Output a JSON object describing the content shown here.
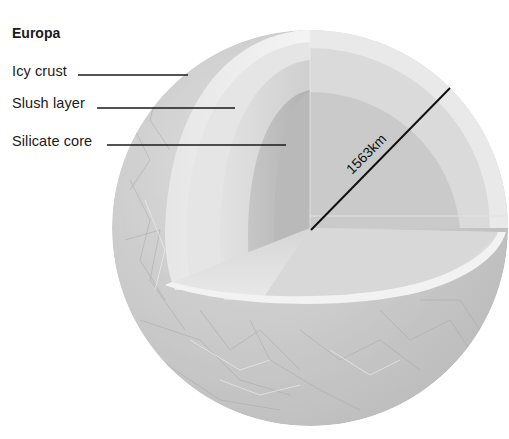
{
  "title": "Europa",
  "labels": [
    {
      "id": "icy-crust",
      "text": "Icy crust",
      "y": 63
    },
    {
      "id": "slush-layer",
      "text": "Slush layer",
      "y": 95
    },
    {
      "id": "silicate-core",
      "text": "Silicate core",
      "y": 133
    }
  ],
  "radius_label": "1563km",
  "colors": {
    "surface": "#c9c9c9",
    "crust": "#e4e4e4",
    "slush": "#d2d2d2",
    "core": "#bdbdbd",
    "cut_face_light": "#dcdcdc",
    "line": "#1a1a1a"
  }
}
